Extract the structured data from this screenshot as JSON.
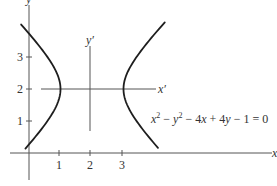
{
  "figure": {
    "axes": {
      "x_label": "x",
      "y_label": "y",
      "x_prime_label": "x′",
      "y_prime_label": "y′"
    },
    "x_ticks": [
      {
        "value": 1,
        "label": "1"
      },
      {
        "value": 2,
        "label": "2"
      },
      {
        "value": 3,
        "label": "3"
      }
    ],
    "y_ticks": [
      {
        "value": 1,
        "label": "1"
      },
      {
        "value": 2,
        "label": "2"
      },
      {
        "value": 3,
        "label": "3"
      }
    ],
    "equation": {
      "parts": [
        "x",
        "2",
        " − ",
        "y",
        "2",
        " − 4",
        "x",
        " + 4",
        "y",
        " − 1 = 0"
      ],
      "text": "x² − y² − 4x + 4y − 1 = 0"
    },
    "curve_color": "#1e1e1e",
    "axis_color": "#555555"
  },
  "chart_data": {
    "type": "line",
    "title": "",
    "equation": "x^2 - y^2 - 4x + 4y - 1 = 0",
    "standard_form": "(x-2)^2 - (y-2)^2 = 1",
    "center": [
      2,
      2
    ],
    "vertices": [
      [
        1,
        2
      ],
      [
        3,
        2
      ]
    ],
    "translated_axes": {
      "x_prime": "y = 2",
      "y_prime": "x = 2"
    },
    "xlabel": "x",
    "ylabel": "y",
    "x_ticks": [
      1,
      2,
      3
    ],
    "y_ticks": [
      1,
      2,
      3
    ],
    "xlim": [
      -0.6,
      7.8
    ],
    "ylim": [
      -1.0,
      4.8
    ],
    "grid": false,
    "series": [
      {
        "name": "left branch",
        "t_range": [
          -1.38,
          1.45
        ],
        "x": "2 - cosh(t)",
        "y": "2 + sinh(t)"
      },
      {
        "name": "right branch",
        "t_range": [
          -1.37,
          1.48
        ],
        "x": "2 + cosh(t)",
        "y": "2 + sinh(t)"
      }
    ]
  }
}
